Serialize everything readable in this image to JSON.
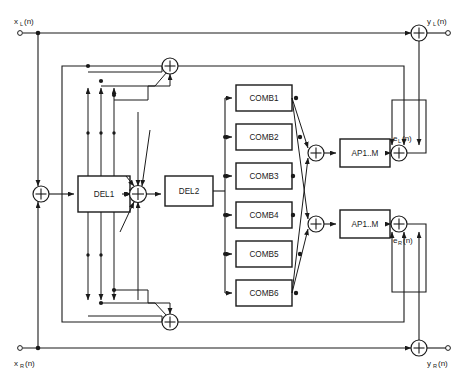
{
  "diagram": {
    "type": "signal-flow-block-diagram",
    "inputs": [
      {
        "id": "xL",
        "label": "x",
        "subscript": "L",
        "suffix": "(n)",
        "full": "xL(n)",
        "x": 22,
        "y": 28
      },
      {
        "id": "xR",
        "label": "x",
        "subscript": "R",
        "suffix": "(n)",
        "full": "xR(n)",
        "x": 22,
        "y": 352
      }
    ],
    "outputs": [
      {
        "id": "yL",
        "label": "y",
        "subscript": "L",
        "suffix": "(n)",
        "full": "yL(n)",
        "x": 438,
        "y": 28
      },
      {
        "id": "yR",
        "label": "y",
        "subscript": "R",
        "suffix": "(n)",
        "full": "yR(n)",
        "x": 438,
        "y": 352
      }
    ],
    "internal_signals": [
      {
        "id": "eL",
        "label": "e",
        "subscript": "L",
        "suffix": "(n)",
        "full": "eL(n)",
        "x": 398,
        "y": 140
      },
      {
        "id": "eR",
        "label": "e",
        "subscript": "R",
        "suffix": "(n)",
        "full": "eR(n)",
        "x": 398,
        "y": 240
      }
    ],
    "delay_blocks": [
      {
        "id": "del1",
        "label": "DEL1",
        "x": 78,
        "y": 176,
        "w": 52,
        "h": 36
      },
      {
        "id": "del2",
        "label": "DEL2",
        "x": 165,
        "y": 176,
        "w": 48,
        "h": 30
      }
    ],
    "comb_blocks": [
      {
        "id": "comb1",
        "label": "COMB1",
        "x": 236,
        "y": 85,
        "w": 56,
        "h": 26
      },
      {
        "id": "comb2",
        "label": "COMB2",
        "x": 236,
        "y": 124,
        "w": 56,
        "h": 26
      },
      {
        "id": "comb3",
        "label": "COMB3",
        "x": 236,
        "y": 163,
        "w": 56,
        "h": 26
      },
      {
        "id": "comb4",
        "label": "COMB4",
        "x": 236,
        "y": 202,
        "w": 56,
        "h": 26
      },
      {
        "id": "comb5",
        "label": "COMB5",
        "x": 236,
        "y": 241,
        "w": 56,
        "h": 26
      },
      {
        "id": "comb6",
        "label": "COMB6",
        "x": 236,
        "y": 280,
        "w": 56,
        "h": 26
      }
    ],
    "allpass_blocks": [
      {
        "id": "apL",
        "label": "AP1..M",
        "x": 340,
        "y": 139,
        "w": 50,
        "h": 28
      },
      {
        "id": "apR",
        "label": "AP1..M",
        "x": 340,
        "y": 210,
        "w": 50,
        "h": 28
      }
    ],
    "summers": [
      {
        "id": "sum-input-left",
        "cx": 41,
        "cy": 194,
        "r": 8
      },
      {
        "id": "sum-center",
        "cx": 138,
        "cy": 194,
        "r": 8.5
      },
      {
        "id": "sum-top-fb",
        "cx": 170,
        "cy": 66,
        "r": 8
      },
      {
        "id": "sum-bottom-fb",
        "cx": 170,
        "cy": 322,
        "r": 8
      },
      {
        "id": "sum-comb-left",
        "cx": 316,
        "cy": 153,
        "r": 8
      },
      {
        "id": "sum-comb-right",
        "cx": 316,
        "cy": 224,
        "r": 8
      },
      {
        "id": "sum-eL",
        "cx": 399,
        "cy": 153,
        "r": 8
      },
      {
        "id": "sum-eR",
        "cx": 399,
        "cy": 224,
        "r": 8
      },
      {
        "id": "sum-out-left",
        "cx": 419,
        "cy": 33,
        "r": 8
      },
      {
        "id": "sum-out-right",
        "cx": 419,
        "cy": 348,
        "r": 8
      }
    ],
    "colors": {
      "line": "#1a1a1a",
      "background": "#ffffff",
      "block_fill": "#ffffff"
    }
  }
}
